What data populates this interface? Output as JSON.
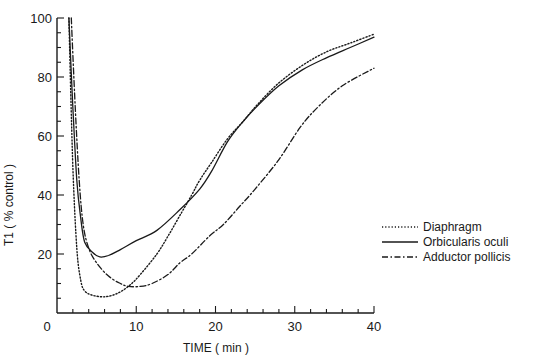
{
  "chart_data": {
    "type": "line",
    "title": "",
    "xlabel": "TIME ( min )",
    "ylabel": "T1 ( % control )",
    "xlim": [
      0,
      40
    ],
    "ylim": [
      0,
      100
    ],
    "x_ticks": [
      0,
      10,
      20,
      30,
      40
    ],
    "y_ticks": [
      0,
      20,
      40,
      60,
      80,
      100
    ],
    "x_minor_step": 2,
    "y_minor_step": 5,
    "grid": false,
    "legend_position": "right-middle",
    "series": [
      {
        "name": "Diaphragm",
        "style": "dotted",
        "points": [
          [
            1.5,
            100
          ],
          [
            2,
            50
          ],
          [
            2.5,
            22
          ],
          [
            3,
            11
          ],
          [
            3.5,
            7.5
          ],
          [
            4.5,
            6
          ],
          [
            6,
            5.5
          ],
          [
            7.5,
            6.5
          ],
          [
            9,
            9
          ],
          [
            10.5,
            13
          ],
          [
            12.6,
            20
          ],
          [
            14,
            26
          ],
          [
            15.5,
            33
          ],
          [
            17,
            40
          ],
          [
            18,
            45
          ],
          [
            19.5,
            51
          ],
          [
            21.5,
            59
          ],
          [
            23.5,
            65
          ],
          [
            25.4,
            71
          ],
          [
            28,
            78
          ],
          [
            31,
            84
          ],
          [
            34,
            88.5
          ],
          [
            37,
            91.5
          ],
          [
            40,
            94.5
          ]
        ]
      },
      {
        "name": "Orbicularis oculi",
        "style": "solid",
        "points": [
          [
            1.5,
            100
          ],
          [
            2,
            70
          ],
          [
            2.5,
            45
          ],
          [
            3,
            32
          ],
          [
            3.5,
            24
          ],
          [
            4.5,
            20.5
          ],
          [
            5.4,
            19
          ],
          [
            6.5,
            19.5
          ],
          [
            8,
            21.5
          ],
          [
            10,
            24.5
          ],
          [
            12.6,
            28
          ],
          [
            15.5,
            35
          ],
          [
            18,
            42
          ],
          [
            19.5,
            48
          ],
          [
            21.5,
            58
          ],
          [
            23.5,
            65
          ],
          [
            25.4,
            70.5
          ],
          [
            28,
            77
          ],
          [
            31,
            82.5
          ],
          [
            34,
            86.5
          ],
          [
            37,
            90
          ],
          [
            40,
            93.5
          ]
        ]
      },
      {
        "name": "Adductor pollicis",
        "style": "dash-dot",
        "points": [
          [
            1.8,
            100
          ],
          [
            2.3,
            70
          ],
          [
            2.8,
            45
          ],
          [
            3.3,
            30
          ],
          [
            4,
            22
          ],
          [
            5,
            17
          ],
          [
            6.5,
            12.5
          ],
          [
            8,
            10
          ],
          [
            9,
            9
          ],
          [
            10.5,
            9
          ],
          [
            12,
            10
          ],
          [
            14,
            13
          ],
          [
            15.5,
            17
          ],
          [
            17,
            20
          ],
          [
            19.2,
            26
          ],
          [
            21,
            30
          ],
          [
            23,
            36
          ],
          [
            25,
            42
          ],
          [
            28,
            52
          ],
          [
            30.7,
            63
          ],
          [
            33,
            70
          ],
          [
            36,
            77
          ],
          [
            40,
            83
          ]
        ]
      }
    ]
  },
  "axes": {
    "x_tick_labels": [
      "0",
      "10",
      "20",
      "30",
      "40"
    ],
    "y_tick_labels": [
      "20",
      "40",
      "60",
      "80",
      "100"
    ],
    "origin_label": "0",
    "x_title": "TIME ( min )",
    "y_title": "T1 ( % control )"
  },
  "legend": {
    "items": [
      {
        "label": "Diaphragm",
        "style": "dotted"
      },
      {
        "label": "Orbicularis oculi",
        "style": "solid"
      },
      {
        "label": "Adductor pollicis",
        "style": "dash-dot"
      }
    ]
  },
  "colors": {
    "line": "#1a1a1a",
    "background": "#ffffff"
  }
}
